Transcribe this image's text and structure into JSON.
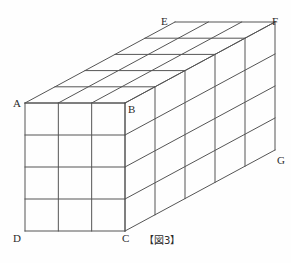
{
  "figure": {
    "caption": "【図3】",
    "projection": "oblique",
    "dimensions": {
      "width_cells": 3,
      "height_cells": 4,
      "depth_cells": 5
    },
    "stroke_color": "#555555",
    "stroke_width": 1,
    "background_color": "#fefefe",
    "label_color": "#2b2b2b",
    "vertices": [
      {
        "name": "A",
        "x": 25,
        "y": 103,
        "label_x": 13,
        "label_y": 98
      },
      {
        "name": "B",
        "x": 125,
        "y": 103,
        "label_x": 128,
        "label_y": 104
      },
      {
        "name": "C",
        "x": 125,
        "y": 231,
        "label_x": 122,
        "label_y": 233
      },
      {
        "name": "D",
        "x": 25,
        "y": 231,
        "label_x": 13,
        "label_y": 233
      },
      {
        "name": "E",
        "x": 175,
        "y": 22,
        "label_x": 161,
        "label_y": 16
      },
      {
        "name": "F",
        "x": 275,
        "y": 22,
        "label_x": 272,
        "label_y": 16
      },
      {
        "name": "G",
        "x": 275,
        "y": 150,
        "label_x": 277,
        "label_y": 155
      }
    ],
    "depth_offset": {
      "dx": 150,
      "dy": -81
    }
  }
}
